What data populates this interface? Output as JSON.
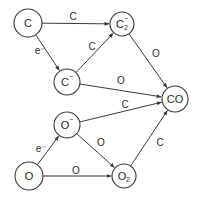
{
  "diagram": {
    "type": "reaction-network",
    "colors": {
      "stroke": "#3a3a3a",
      "text": "#2a2a2a",
      "background": "#ffffff"
    },
    "nodes": [
      {
        "id": "C",
        "label": "C",
        "sup": "",
        "sub": "",
        "x": 28,
        "y": 23,
        "r": 14
      },
      {
        "id": "C2m",
        "label": "C",
        "sup": "−",
        "sub": "2",
        "x": 122,
        "y": 24,
        "r": 12
      },
      {
        "id": "Cm",
        "label": "C",
        "sup": "−",
        "sub": "",
        "x": 67,
        "y": 82,
        "r": 13
      },
      {
        "id": "Om",
        "label": "O",
        "sup": "−",
        "sub": "",
        "x": 67,
        "y": 125,
        "r": 13
      },
      {
        "id": "O",
        "label": "O",
        "sup": "",
        "sub": "",
        "x": 29,
        "y": 176,
        "r": 14
      },
      {
        "id": "O2",
        "label": "O",
        "sup": "",
        "sub": "2",
        "x": 124,
        "y": 176,
        "r": 12
      },
      {
        "id": "CO",
        "label": "CO",
        "sup": "",
        "sub": "",
        "x": 175,
        "y": 99,
        "r": 13
      }
    ],
    "edges": [
      {
        "from": "C",
        "to": "C2m",
        "label": "C",
        "lx": 73,
        "ly": 16
      },
      {
        "from": "C",
        "to": "Cm",
        "label": "e⁻",
        "lx": 40,
        "ly": 50
      },
      {
        "from": "Cm",
        "to": "C2m",
        "label": "C",
        "lx": 92,
        "ly": 46
      },
      {
        "from": "C2m",
        "to": "CO",
        "label": "O",
        "lx": 156,
        "ly": 53
      },
      {
        "from": "Cm",
        "to": "CO",
        "label": "O",
        "lx": 121,
        "ly": 80
      },
      {
        "from": "Om",
        "to": "CO",
        "label": "C",
        "lx": 125,
        "ly": 104
      },
      {
        "from": "O",
        "to": "Om",
        "label": "e⁻",
        "lx": 41,
        "ly": 148
      },
      {
        "from": "Om",
        "to": "O2",
        "label": "O",
        "lx": 101,
        "ly": 142
      },
      {
        "from": "O",
        "to": "O2",
        "label": "O",
        "lx": 76,
        "ly": 170
      },
      {
        "from": "O2",
        "to": "CO",
        "label": "C",
        "lx": 160,
        "ly": 142
      }
    ]
  }
}
